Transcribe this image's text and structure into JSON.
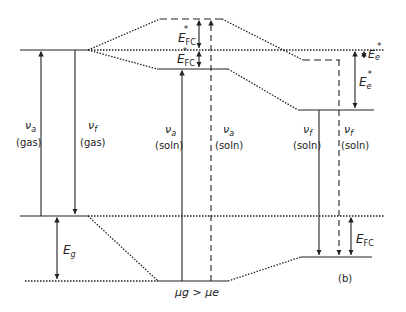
{
  "diagram": {
    "caption": "(b)",
    "bottom_label": "μg > μe",
    "transitions": [
      {
        "symbol": "ν",
        "sub": "a",
        "medium": "(gas)"
      },
      {
        "symbol": "ν",
        "sub": "f",
        "medium": "(gas)"
      },
      {
        "symbol": "ν",
        "sub": "a",
        "medium": "(soln)"
      },
      {
        "symbol": "ν",
        "sub": "a",
        "medium": "(soln)"
      },
      {
        "symbol": "ν",
        "sub": "f",
        "medium": "(soln)"
      },
      {
        "symbol": "ν",
        "sub": "f",
        "medium": "(soln)"
      }
    ],
    "energies": {
      "eg": {
        "main": "E",
        "sub": "g"
      },
      "efc_star_upper": {
        "main": "E",
        "sub": "FC",
        "sup": "*"
      },
      "efc_star_lower": {
        "main": "E",
        "sub": "FC",
        "sup": "*"
      },
      "ee_star_small": {
        "main": "E",
        "sub": "e",
        "sup": "*"
      },
      "ee_star_large": {
        "main": "E",
        "sub": "e",
        "sup": "*"
      },
      "efc": {
        "main": "E",
        "sub": "FC"
      }
    }
  }
}
